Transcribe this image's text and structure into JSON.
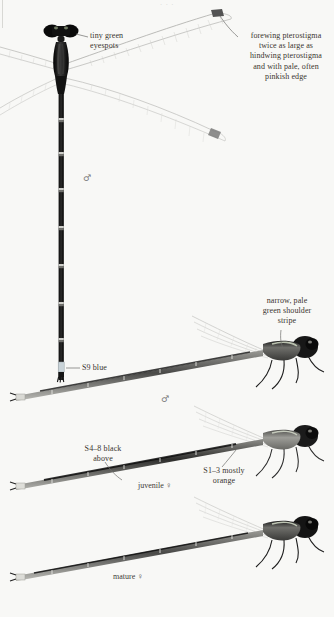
{
  "page": {
    "background_color": "#f8f8f6",
    "ink_color": "#2b2b2b",
    "top_cut_text": "· · ·"
  },
  "plate": {
    "title": "Damselfly identification plate",
    "specimens": [
      {
        "id": "dorsal-male",
        "view": "dorsal",
        "sex_symbol": "♂",
        "caption": ""
      },
      {
        "id": "lateral-male",
        "view": "lateral",
        "sex_symbol": "♂",
        "caption": ""
      },
      {
        "id": "lateral-juvenile-female",
        "view": "lateral",
        "sex_symbol": "♀",
        "caption": "juvenile ♀"
      },
      {
        "id": "lateral-mature-female",
        "view": "lateral",
        "sex_symbol": "♀",
        "caption": "mature ♀"
      }
    ]
  },
  "annotations": {
    "eyespots": {
      "text": "tiny green\neyespots"
    },
    "pterostigma": {
      "text": "forewing pterostigma\ntwice as large as\nhindwing pterostigma\nand with pale, often\npinkish edge"
    },
    "s9_blue": {
      "text": "S9 blue"
    },
    "shoulder": {
      "text": "narrow, pale\ngreen shoulder\nstripe"
    },
    "s4_8_black": {
      "text": "S4–8 black\nabove"
    },
    "s1_3_orange": {
      "text": "S1–3 mostly\norange"
    }
  },
  "labels": {
    "male_symbol_top": "♂",
    "male_symbol_mid": "♂",
    "juvenile_female": "juvenile ♀",
    "mature_female": "mature ♀"
  }
}
